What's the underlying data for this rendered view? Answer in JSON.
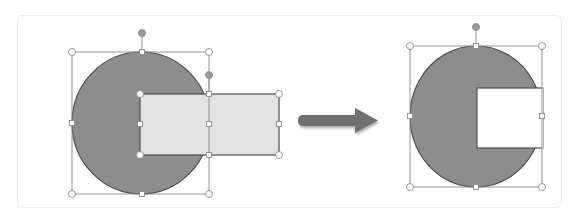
{
  "diagram": {
    "colors": {
      "circle_fill": "#8d8d8d",
      "shape_stroke": "#4f4f4f",
      "rect_fill": "#e2e2e2",
      "handle_stroke": "#8a8a8a",
      "handle_fill": "#ffffff",
      "rotate_handle_fill": "#9a9a9a",
      "arrow_fill": "#6f6f6f",
      "panel_border": "#ececec"
    },
    "before": {
      "label": "circle-and-rectangle-selected",
      "circle": {
        "cx": 141,
        "cy": 123,
        "rx": 69,
        "ry": 71
      },
      "circle_bbox": {
        "x": 72,
        "y": 52,
        "w": 137,
        "h": 142
      },
      "rect": {
        "x": 140,
        "y": 94,
        "w": 139,
        "h": 61
      }
    },
    "arrow": {
      "label": "result-arrow",
      "direction": "right"
    },
    "after": {
      "label": "subtracted-shape-result",
      "bbox": {
        "x": 410,
        "y": 46,
        "w": 132,
        "h": 141
      },
      "notch": {
        "x": 477,
        "y": 88,
        "w": 65,
        "h": 60
      }
    }
  }
}
